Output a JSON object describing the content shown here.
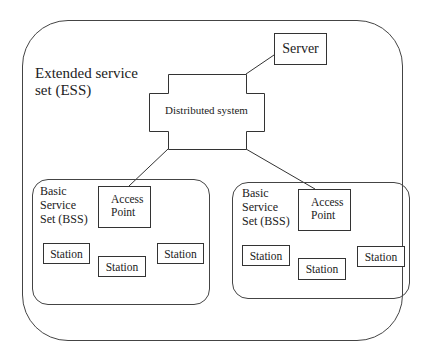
{
  "ess": {
    "label_line1": "Extended service",
    "label_line2": "set (ESS)"
  },
  "server": {
    "label": "Server"
  },
  "distributed_system": {
    "label": "Distributed system"
  },
  "bss": [
    {
      "label_line1": "Basic",
      "label_line2": "Service",
      "label_line3": "Set (BSS)",
      "access_point": {
        "line1": "Access",
        "line2": "Point"
      },
      "stations": [
        "Station",
        "Station",
        "Station"
      ]
    },
    {
      "label_line1": "Basic",
      "label_line2": "Service",
      "label_line3": "Set (BSS)",
      "access_point": {
        "line1": "Access",
        "line2": "Point"
      },
      "stations": [
        "Station",
        "Station",
        "Station"
      ]
    }
  ],
  "colors": {
    "stroke": "#333333",
    "background": "#ffffff",
    "text": "#222222"
  }
}
